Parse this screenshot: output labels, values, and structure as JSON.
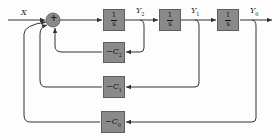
{
  "diagram": {
    "type": "block-diagram",
    "input": {
      "label": "X"
    },
    "summing_junction": {
      "symbol": "+"
    },
    "integrators": [
      {
        "num": "1",
        "den": "s",
        "output_label": "Y",
        "output_sub": "2"
      },
      {
        "num": "1",
        "den": "s",
        "output_label": "Y",
        "output_sub": "1"
      },
      {
        "num": "1",
        "den": "s",
        "output_label": "Y",
        "output_sub": "0"
      }
    ],
    "feedback_gains": [
      {
        "prefix": "−C",
        "sub": "2",
        "from": "Y2"
      },
      {
        "prefix": "−C",
        "sub": "1",
        "from": "Y1"
      },
      {
        "prefix": "−C",
        "sub": "0",
        "from": "Y0"
      }
    ],
    "colors": {
      "block_fill": "#8a8a8a",
      "line": "#333333",
      "junction": "#8a8a8a"
    }
  }
}
